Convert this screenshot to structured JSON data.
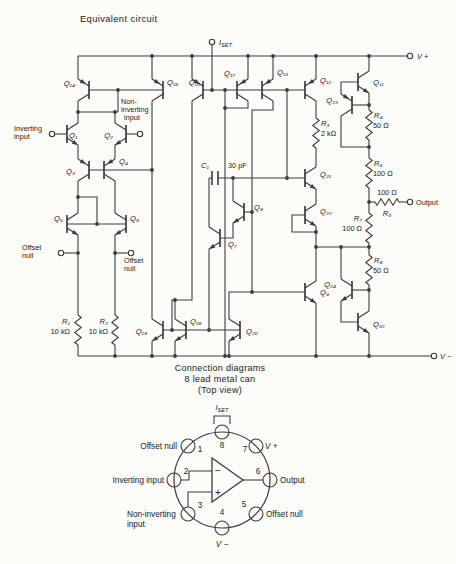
{
  "title": "Equivalent circuit",
  "rails": {
    "vplus": "V +",
    "vminus": "V −"
  },
  "iset": {
    "base": "I",
    "sub": "SET"
  },
  "io": {
    "inverting": [
      "Inverting",
      "input"
    ],
    "noninverting": [
      "Non-",
      "inverting",
      "input"
    ],
    "offset_left": [
      "Offset",
      "null"
    ],
    "offset_right": [
      "Offset",
      "null"
    ],
    "output": "Output"
  },
  "transistors": {
    "q1": "Q₁",
    "q2": "Q₂",
    "q3": "Q₃",
    "q4": "Q₄",
    "q5": "Q₅",
    "q6": "Q₆",
    "q7": "Q₇",
    "q8": "Q₈",
    "q9": "Q₉",
    "q10": "Q₁₀",
    "q11": "Q₁₁",
    "q12": "Q₁₂",
    "q13": "Q₁₃",
    "q14": "Q₁₄",
    "q15": "Q₁₅",
    "q16": "Q₁₆",
    "q17": "Q₁₇",
    "q18": "Q₁₈",
    "q19": "Q₁₉",
    "q20": "Q₂₀",
    "q21": "Q₂₁",
    "q22": "Q₂₂",
    "q23": "Q₂₃",
    "q24": "Q₂₄"
  },
  "passives": {
    "r1": {
      "name": "R₁",
      "value": "10 kΩ"
    },
    "r2": {
      "name": "R₂",
      "value": "10 kΩ"
    },
    "r3": {
      "name": "R₃",
      "value": "2 kΩ"
    },
    "r4": {
      "name": "R₄",
      "value": "50 Ω"
    },
    "r5": {
      "name": "R₅",
      "value": "100 Ω"
    },
    "r6": {
      "name": "R₆",
      "value": "100 Ω"
    },
    "r7": {
      "name": "R₇",
      "value": "100 Ω"
    },
    "r8": {
      "name": "R₈",
      "value": "50 Ω"
    },
    "c1": {
      "name": "C₁",
      "value": "30 pF"
    }
  },
  "connection": {
    "heading": [
      "Connection diagrams",
      "8 lead metal can",
      "(Top view)"
    ],
    "iset": {
      "base": "I",
      "sub": "SET"
    },
    "opamp": {
      "minus": "−",
      "plus": "+"
    },
    "pins": [
      {
        "num": "1",
        "label": [
          "Offset null"
        ]
      },
      {
        "num": "2",
        "label": [
          "Inverting input"
        ]
      },
      {
        "num": "3",
        "label": [
          "Non-inverting",
          "input"
        ]
      },
      {
        "num": "4",
        "label": [
          "V −"
        ]
      },
      {
        "num": "5",
        "label": [
          "Offset null"
        ]
      },
      {
        "num": "6",
        "label": [
          "Output"
        ]
      },
      {
        "num": "7",
        "label": [
          "V +"
        ]
      },
      {
        "num": "8",
        "label": []
      }
    ]
  }
}
